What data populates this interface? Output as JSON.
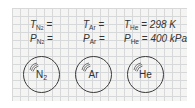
{
  "diagram": {
    "title": "",
    "background": "graph-paper grid",
    "colors": {
      "grid_line": "#d6d8da",
      "panel_bg": "#f4f4f2",
      "ink": "#333333"
    },
    "containers": [
      {
        "gas": "N",
        "gas_subscript": "2",
        "temperature": {
          "symbol": "T",
          "subscript": "N2",
          "sub_main": "N",
          "sub_small": "2",
          "equals": "=",
          "value": ""
        },
        "pressure": {
          "symbol": "P",
          "subscript": "N2",
          "sub_main": "N",
          "sub_small": "2",
          "equals": "=",
          "value": ""
        }
      },
      {
        "gas": "Ar",
        "gas_subscript": "",
        "temperature": {
          "symbol": "T",
          "subscript": "Ar",
          "equals": "=",
          "value": ""
        },
        "pressure": {
          "symbol": "P",
          "subscript": "Ar",
          "equals": "=",
          "value": ""
        }
      },
      {
        "gas": "He",
        "gas_subscript": "",
        "temperature": {
          "symbol": "T",
          "subscript": "He",
          "equals": "=",
          "value": "298 K"
        },
        "pressure": {
          "symbol": "P",
          "subscript": "He",
          "equals": "=",
          "value": "400 kPa"
        }
      }
    ]
  }
}
